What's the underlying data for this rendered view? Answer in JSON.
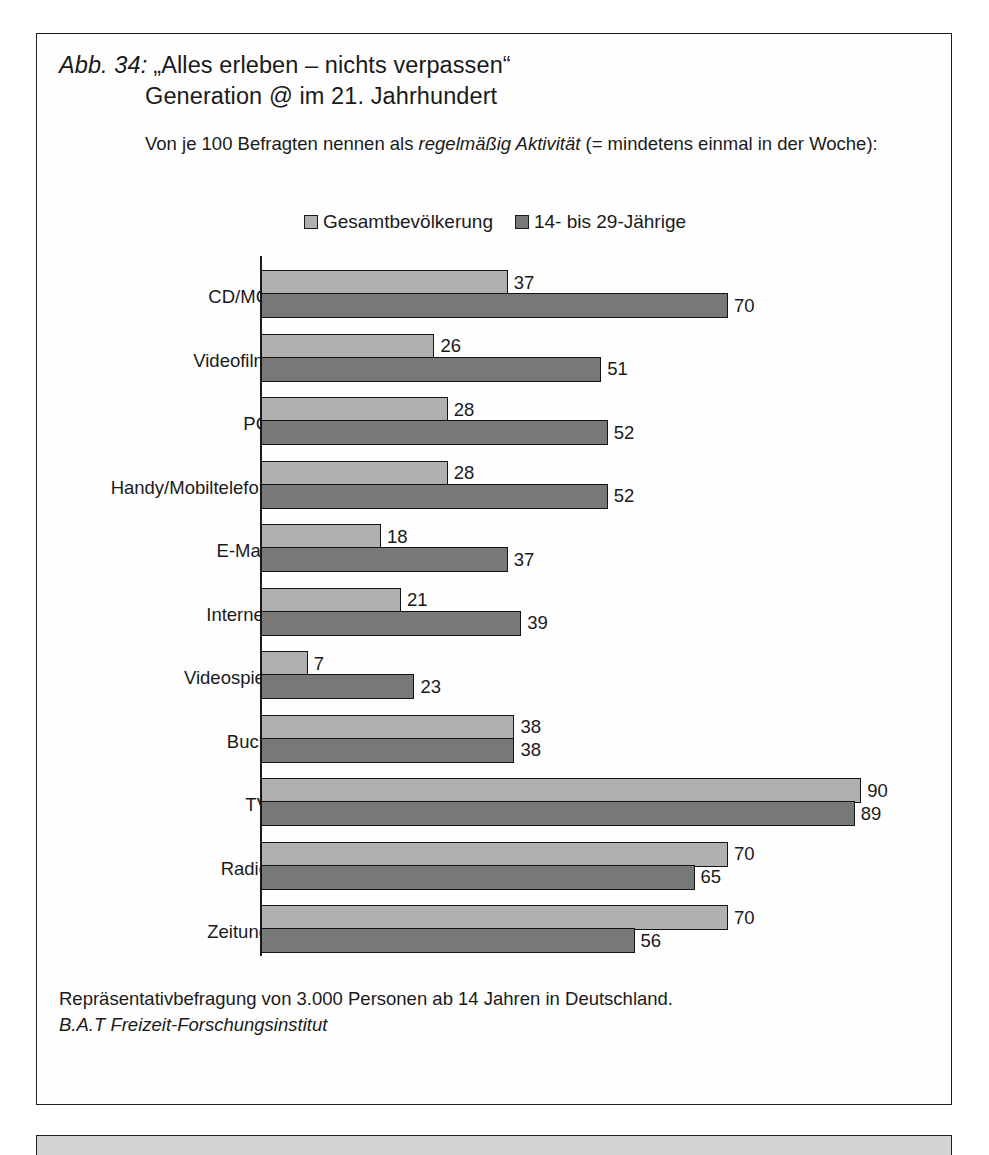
{
  "figure": {
    "number_label": "Abb. 34:",
    "title_line_1": "„Alles erleben – nichts verpassen“",
    "title_line_2": "Generation @ im 21. Jahrhundert",
    "subtitle_part_1": "Von je 100 Befragten nennen als ",
    "subtitle_emphasis": "regelmäßig Aktivität",
    "subtitle_part_2": " (= mindetens einmal in der Woche):",
    "footnote": "Repräsentativbefragung von 3.000 Personen ab 14 Jahren in Deutschland.",
    "source": "B.A.T Freizeit-Forschungsinstitut"
  },
  "chart_data": {
    "type": "bar",
    "orientation": "horizontal",
    "title": "„Alles erleben – nichts verpassen“ Generation @ im 21. Jahrhundert",
    "subtitle": "Von je 100 Befragten nennen als regelmäßig Aktivität (= mindetens einmal in der Woche):",
    "xlabel": "",
    "ylabel": "",
    "xlim": [
      0,
      100
    ],
    "grid": false,
    "legend_position": "top-center",
    "categories": [
      "CD/MC",
      "Videofilm",
      "PC",
      "Handy/Mobiltelefon",
      "E-Mail",
      "Internet",
      "Videospiel",
      "Buch",
      "TV",
      "Radio",
      "Zeitung"
    ],
    "series": [
      {
        "name": "Gesamtbevölkerung",
        "color": "#b0b0b0",
        "values": [
          37,
          26,
          28,
          28,
          18,
          21,
          7,
          38,
          90,
          70,
          70
        ]
      },
      {
        "name": "14- bis 29-Jährige",
        "color": "#787878",
        "values": [
          70,
          51,
          52,
          52,
          37,
          39,
          23,
          38,
          89,
          65,
          56
        ]
      }
    ],
    "footnote": "Repräsentativbefragung von 3.000 Personen ab 14 Jahren in Deutschland.",
    "source": "B.A.T Freizeit-Forschungsinstitut"
  }
}
